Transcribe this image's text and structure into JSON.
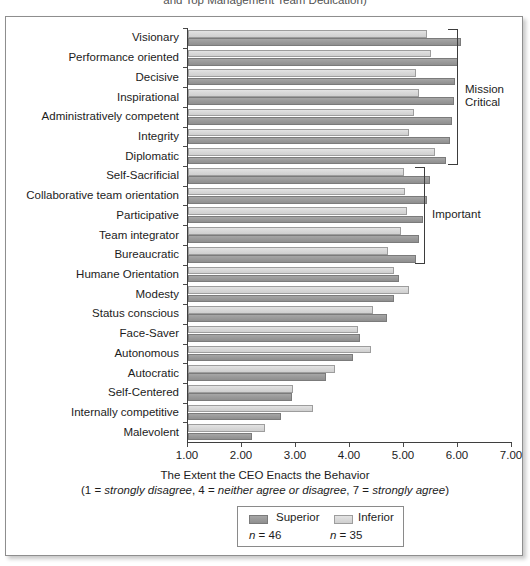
{
  "caption_tail": "and Top Management Team Dedication)",
  "chart_data": {
    "type": "bar",
    "orientation": "horizontal",
    "title": "",
    "xlabel": "The Extent the CEO Enacts the Behavior",
    "xlabel_note_prefix": "(1 = ",
    "xlabel_note_italic1": "strongly disagree",
    "xlabel_note_mid1": ", 4 = ",
    "xlabel_note_italic2": "neither agree or disagree",
    "xlabel_note_mid2": ", 7 = ",
    "xlabel_note_italic3": "strongly agree",
    "xlabel_note_suffix": ")",
    "ylabel": "",
    "xlim": [
      1.0,
      7.0
    ],
    "xticks": [
      1.0,
      2.0,
      3.0,
      4.0,
      5.0,
      6.0,
      7.0
    ],
    "xtick_labels": [
      "1.00",
      "2.00",
      "3.00",
      "4.00",
      "5.00",
      "6.00",
      "7.00"
    ],
    "grid": false,
    "legend_position": "bottom-center",
    "categories": [
      "Visionary",
      "Performance oriented",
      "Decisive",
      "Inspirational",
      "Administratively competent",
      "Integrity",
      "Diplomatic",
      "Self-Sacrificial",
      "Collaborative team orientation",
      "Participative",
      "Team integrator",
      "Bureaucratic",
      "Humane Orientation",
      "Modesty",
      "Status conscious",
      "Face-Saver",
      "Autonomous",
      "Autocratic",
      "Self-Centered",
      "Internally competitive",
      "Malevolent"
    ],
    "series": [
      {
        "name": "Superior",
        "n_label": "n = 46",
        "n_value": 46,
        "color": "#9b9b9b",
        "values": [
          6.05,
          6.0,
          5.95,
          5.92,
          5.88,
          5.85,
          5.78,
          5.48,
          5.42,
          5.35,
          5.28,
          5.22,
          4.9,
          4.82,
          4.68,
          4.18,
          4.05,
          3.55,
          2.92,
          2.72,
          2.18
        ]
      },
      {
        "name": "Inferior",
        "n_label": "n = 35",
        "n_value": 35,
        "color": "#d9d9d9",
        "values": [
          5.42,
          5.5,
          5.22,
          5.28,
          5.18,
          5.1,
          5.58,
          5.0,
          5.02,
          5.05,
          4.95,
          4.7,
          4.82,
          5.1,
          4.42,
          4.15,
          4.38,
          3.72,
          2.95,
          3.32,
          2.42
        ]
      }
    ],
    "annotations": [
      {
        "label": "Mission\nCritical",
        "label_line1": "Mission",
        "label_line2": "Critical",
        "from_category": "Visionary",
        "to_category": "Diplomatic",
        "from_index": 0,
        "to_index": 6
      },
      {
        "label": "Important",
        "label_line1": "Important",
        "label_line2": "",
        "from_category": "Self-Sacrificial",
        "to_category": "Bureaucratic",
        "from_index": 7,
        "to_index": 11
      }
    ]
  }
}
